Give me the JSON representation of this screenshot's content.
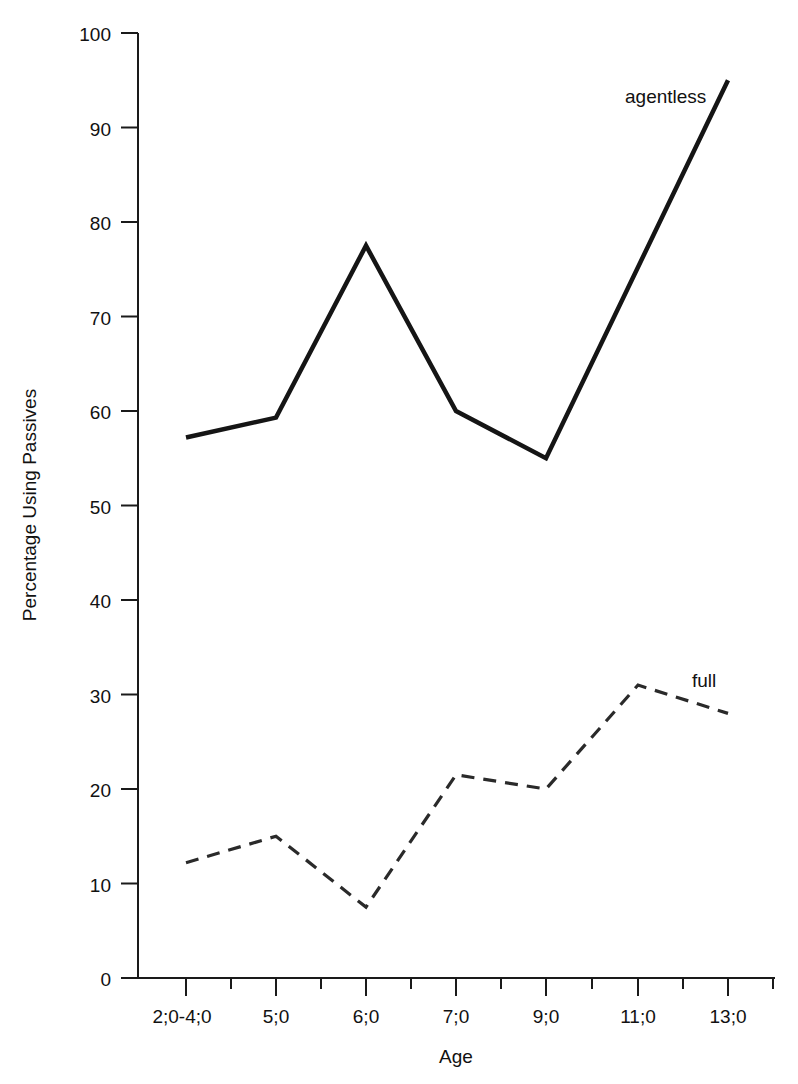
{
  "chart_data": {
    "type": "line",
    "title": "",
    "xlabel": "Age",
    "ylabel": "Percentage Using Passives",
    "categories": [
      "2;0-4;0",
      "5;0",
      "6;0",
      "7;0",
      "9;0",
      "11;0",
      "13;0"
    ],
    "ylim": [
      0,
      100
    ],
    "ytick_values": [
      0,
      10,
      20,
      30,
      40,
      50,
      60,
      70,
      80,
      90,
      100
    ],
    "ytick_labels": [
      "0",
      "10",
      "20",
      "30",
      "40",
      "50",
      "60",
      "70",
      "80",
      "90",
      "100"
    ],
    "grid": false,
    "legend_position": "inline-end-of-line",
    "series": [
      {
        "name": "agentless",
        "style": "solid",
        "color": "#151515",
        "label_text": "agentless",
        "values": [
          57.2,
          59.3,
          77.5,
          60.0,
          55.0,
          75.0,
          95.0
        ],
        "vertex_at_11_0": false
      },
      {
        "name": "full",
        "style": "dashed",
        "color": "#2a2a2a",
        "label_text": "full",
        "values": [
          12.2,
          15.0,
          7.5,
          21.5,
          20.0,
          31.0,
          28.0
        ],
        "vertex_at_11_0": true
      }
    ],
    "annotations": [
      {
        "name": "agentless-series-label",
        "text": "agentless",
        "x_px": 625,
        "y_px": 103
      },
      {
        "name": "full-series-label",
        "text": "full",
        "x_px": 692,
        "y_px": 687
      }
    ]
  },
  "axes": {
    "x_axis_name": "Age",
    "y_axis_name": "Percentage Using Passives",
    "minor_ticks": true
  }
}
